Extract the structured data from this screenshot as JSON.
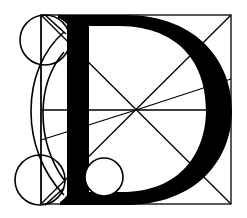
{
  "diagram": {
    "letter": "D",
    "colors": {
      "background": "#ffffff",
      "ink": "#000000"
    },
    "square": {
      "x1": 41,
      "y1": 15,
      "x2": 231,
      "y2": 204
    },
    "center": {
      "x": 136,
      "y": 110
    },
    "circles": [
      {
        "name": "top-left-circle",
        "cx": 45,
        "cy": 40,
        "r": 25
      },
      {
        "name": "bottom-left-circle",
        "cx": 40,
        "cy": 180,
        "r": 25
      },
      {
        "name": "counter-circle",
        "cx": 104,
        "cy": 177,
        "r": 19
      }
    ]
  }
}
